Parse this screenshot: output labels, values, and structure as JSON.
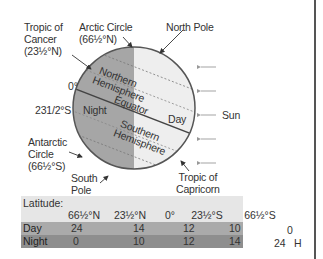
{
  "diagram": {
    "labels": {
      "tropic_cancer": [
        "Tropic of",
        "Cancer",
        "(23½°N)"
      ],
      "arctic_circle": [
        "Arctic Circle",
        "(66½°N)"
      ],
      "north_pole": "North Pole",
      "zero_deg": "0°",
      "lat_23_s": "231/2°S",
      "antarctic_circle": [
        "Antarctic",
        "Circle",
        "(66½°S)"
      ],
      "south_pole": [
        "South",
        "Pole"
      ],
      "tropic_capricorn": [
        "Tropic of",
        "Capricorn"
      ],
      "northern_hemisphere": [
        "Northern",
        "Hemisphere"
      ],
      "southern_hemisphere": [
        "Southern",
        "Hemisphere"
      ],
      "equator": "Equator",
      "night": "Night",
      "day": "Day",
      "sun": "Sun"
    },
    "colors": {
      "night": "#a6a6a6",
      "day": "#eeeeee",
      "outline": "#555555",
      "arrow": "#999999"
    }
  },
  "table": {
    "title": "Latitude:",
    "columns": [
      "66½°N",
      "23½°N",
      "0°",
      "23½°S",
      "66½°S"
    ],
    "rows": [
      {
        "label": "Day",
        "values": [
          "24",
          "14",
          "12",
          "10",
          "0"
        ]
      },
      {
        "label": "Night",
        "values": [
          "0",
          "10",
          "12",
          "14",
          "24"
        ]
      }
    ],
    "unit_suffix": "H"
  }
}
